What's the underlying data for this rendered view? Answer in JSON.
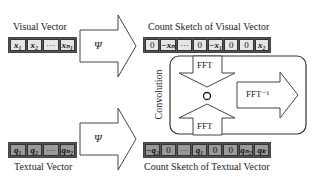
{
  "visual_vector": {
    "label": "Visual Vector",
    "cells": [
      "x₁",
      "x₂",
      "···",
      "xₙ₁"
    ]
  },
  "textual_vector": {
    "label": "Textual Vector",
    "cells": [
      "q₁",
      "q₂",
      "···",
      "qₙ₂"
    ]
  },
  "psi_arrows": {
    "top_label": "Ψ",
    "bottom_label": "Ψ"
  },
  "visual_sketch": {
    "label": "Count Sketch of Visual Vector",
    "cells": [
      "0",
      "−xₙ",
      "···",
      "0",
      "−x₁",
      "0",
      "0",
      "x₂"
    ]
  },
  "textual_sketch": {
    "label": "Count Sketch of Textual Vector",
    "cells": [
      "−q₂",
      "0",
      "···",
      "q₁",
      "0",
      "0",
      "qₙ₂",
      "qₖ"
    ]
  },
  "convolution": {
    "label": "Convolution",
    "fft_top": "FFT",
    "fft_bottom": "FFT",
    "operator": "○",
    "ifft": "FFT⁻¹"
  }
}
